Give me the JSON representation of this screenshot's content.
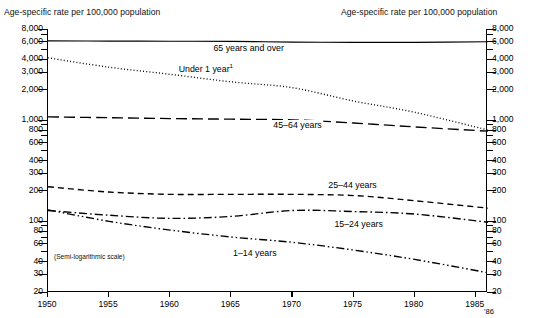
{
  "header": {
    "left_title": "Age-specific rate per 100,000 population",
    "right_title": "Age-specific rate per 100,000 population"
  },
  "notes": {
    "scale_note": "(Semi-logarithmic scale)",
    "footnote_marker": "1"
  },
  "chart_data": {
    "type": "line",
    "title": "Age-specific rate per 100,000 population",
    "xlabel": "",
    "ylabel": "Age-specific rate per 100,000 population",
    "scale": "semi-logarithmic",
    "grid": false,
    "legend_position": "inline-labels",
    "xlim": [
      1950,
      1986
    ],
    "ylim": [
      20,
      8000
    ],
    "x_ticks": [
      1950,
      1955,
      1960,
      1965,
      1970,
      1975,
      1980,
      1985
    ],
    "x_tick_labels": [
      "1950",
      "1955",
      "1960",
      "1965",
      "1970",
      "1975",
      "1980",
      "1985"
    ],
    "x_end_label": "'86",
    "y_ticks": [
      20,
      30,
      40,
      60,
      80,
      100,
      200,
      300,
      400,
      600,
      800,
      1000,
      2000,
      3000,
      4000,
      6000,
      8000
    ],
    "y_tick_labels": [
      "20",
      "30",
      "40",
      "60",
      "80",
      "100",
      "200",
      "300",
      "400",
      "600",
      "800",
      "1,000",
      "2,000",
      "3,000",
      "4,000",
      "6,000",
      "8,000"
    ],
    "y_minor_ticks": [
      50,
      70,
      90,
      500,
      700,
      900,
      5000,
      7000
    ],
    "series": [
      {
        "name": "65 years and over",
        "label": "65 years and over",
        "style": "solid",
        "label_x": 1966.5,
        "label_y": 5100,
        "x": [
          1950,
          1955,
          1960,
          1965,
          1970,
          1975,
          1980,
          1986
        ],
        "values": [
          6100,
          6080,
          6050,
          6030,
          5940,
          5900,
          5900,
          5980
        ]
      },
      {
        "name": "Under 1 year",
        "label": "Under 1 year",
        "style": "dotted",
        "label_x": 1963.0,
        "label_y": 3150,
        "x": [
          1950,
          1955,
          1960,
          1965,
          1970,
          1975,
          1980,
          1986
        ],
        "values": [
          4150,
          3350,
          2850,
          2400,
          2100,
          1550,
          1200,
          800
        ]
      },
      {
        "name": "45-64 years",
        "label": "45–64 years",
        "style": "long-dash",
        "label_x": 1970.5,
        "label_y": 880,
        "x": [
          1950,
          1955,
          1960,
          1965,
          1970,
          1975,
          1980,
          1986
        ],
        "values": [
          1080,
          1060,
          1040,
          1025,
          1010,
          940,
          860,
          780
        ]
      },
      {
        "name": "25-44 years",
        "label": "25–44 years",
        "style": "dash",
        "label_x": 1975.0,
        "label_y": 225,
        "x": [
          1950,
          1955,
          1960,
          1965,
          1970,
          1975,
          1980,
          1986
        ],
        "values": [
          220,
          195,
          185,
          185,
          185,
          180,
          160,
          135
        ]
      },
      {
        "name": "15-24 years",
        "label": "15–24 years",
        "style": "dash-dot",
        "label_x": 1975.5,
        "label_y": 92,
        "x": [
          1950,
          1955,
          1960,
          1965,
          1970,
          1975,
          1980,
          1986
        ],
        "values": [
          128,
          115,
          107,
          112,
          128,
          125,
          118,
          98
        ]
      },
      {
        "name": "1-14 years",
        "label": "1–14 years",
        "style": "dash-dot-dot",
        "label_x": 1967.0,
        "label_y": 47,
        "x": [
          1950,
          1955,
          1960,
          1965,
          1970,
          1975,
          1980,
          1986
        ],
        "values": [
          130,
          100,
          82,
          70,
          62,
          52,
          42,
          31
        ]
      }
    ]
  }
}
